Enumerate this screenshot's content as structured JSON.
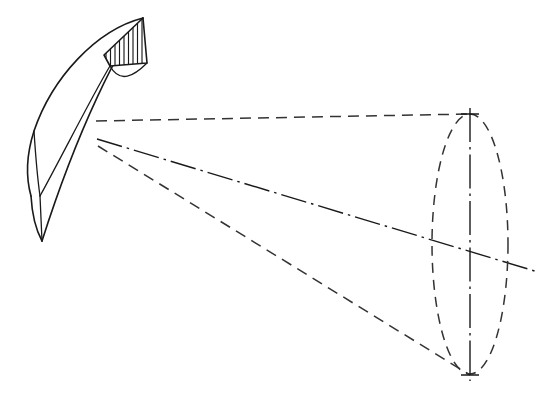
{
  "figure": {
    "type": "engineering-line-drawing",
    "canvas": {
      "width": 543,
      "height": 394,
      "background": "#ffffff"
    },
    "colors": {
      "line": "#1a1a1a",
      "hidden_line": "#333333",
      "fill": "#ffffff"
    },
    "linework": {
      "solid_label": "visible edge",
      "dashed_label": "hidden / projection line",
      "centerline_label": "axis centerline",
      "hatch_label": "section hatching"
    }
  },
  "blade": {
    "name": "curved swept blade",
    "tip_point": {
      "x": 143,
      "y": 18
    },
    "v_notch_point": {
      "x": 40,
      "y": 196
    },
    "bottom_tip_point": {
      "x": 42,
      "y": 241
    },
    "leading_edge_curve": "M143,18 C96,30 52,78 34,131 C26,156 26,178 31,196",
    "trailing_edge_curve": "M143,18 C120,44 78,128 42,241",
    "inner_curve": "M143,18 C122,38 80,120 47,196",
    "lower_curve_left": "M31,196 C32,214 36,230 42,241",
    "lower_curve_inner": "M40,196 C40,212 41,228 42,241",
    "notch_left_curve": "M34,131 C36,162 38,182 40,196",
    "vertical_seam": {
      "x1": 40,
      "y1": 196,
      "x2": 42,
      "y2": 241
    },
    "root_edge": {
      "x1": 143,
      "y1": 18,
      "x2": 42,
      "y2": 241
    }
  },
  "section": {
    "name": "hatched cross-section",
    "outline": "M143,18 L147,63 L110,66 L104,55 Z",
    "hatch_count": 9,
    "hatch_direction": "vertical",
    "hatch_spacing_px": 5
  },
  "cone": {
    "apex_upper": {
      "x": 96,
      "y": 121
    },
    "apex_axis": {
      "x": 97,
      "y": 139
    },
    "apex_lower": {
      "x": 98,
      "y": 146
    },
    "base_ellipse": {
      "center_x": 470,
      "center_y": 244,
      "radius_x": 38,
      "radius_y": 130,
      "rotation_deg": 0
    },
    "upper_generator": {
      "x1": 96,
      "y1": 121,
      "x2": 470,
      "y2": 114
    },
    "lower_generator": {
      "x1": 98,
      "y1": 146,
      "x2": 470,
      "y2": 375
    },
    "axis_line": {
      "x1": 97,
      "y1": 139,
      "x2": 538,
      "y2": 272
    },
    "vertical_axis": {
      "x1": 470,
      "y1": 108,
      "x2": 470,
      "y2": 381
    },
    "top_tick": {
      "x1": 461,
      "y1": 114,
      "x2": 479,
      "y2": 114
    },
    "bottom_tick": {
      "x1": 461,
      "y1": 375,
      "x2": 479,
      "y2": 375
    }
  },
  "annotations": {
    "labels": []
  }
}
